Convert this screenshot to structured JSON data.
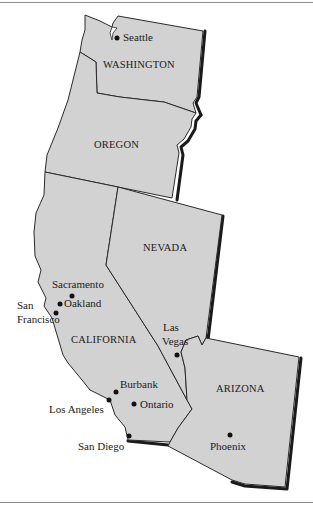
{
  "map": {
    "colors": {
      "land": "#d2d2d2",
      "border": "#2a2a2a",
      "shadow": "#1a1a1a",
      "rule": "#8a8a8a"
    },
    "states": [
      {
        "id": "washington",
        "label": "WASHINGTON"
      },
      {
        "id": "oregon",
        "label": "OREGON"
      },
      {
        "id": "california",
        "label": "CALIFORNIA"
      },
      {
        "id": "nevada",
        "label": "NEVADA"
      },
      {
        "id": "arizona",
        "label": "ARIZONA"
      }
    ],
    "cities": [
      {
        "id": "seattle",
        "label": "Seattle"
      },
      {
        "id": "sacramento",
        "label": "Sacramento"
      },
      {
        "id": "oakland",
        "label": "Oakland"
      },
      {
        "id": "san_francisco",
        "label_line1": "San",
        "label_line2": "Francisco"
      },
      {
        "id": "las_vegas",
        "label_line1": "Las",
        "label_line2": "Vegas"
      },
      {
        "id": "burbank",
        "label": "Burbank"
      },
      {
        "id": "los_angeles",
        "label": "Los Angeles"
      },
      {
        "id": "ontario",
        "label": "Ontario"
      },
      {
        "id": "san_diego",
        "label": "San Diego"
      },
      {
        "id": "phoenix",
        "label": "Phoenix"
      }
    ]
  }
}
